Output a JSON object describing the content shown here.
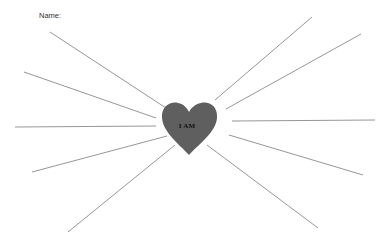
{
  "worksheet": {
    "name_label": "Name:",
    "heart_text": "I AM",
    "heart_color": "#5f5f5f",
    "line_color": "#8a8a8a",
    "rays": [
      {
        "x1": 50,
        "y1": 32,
        "x2": 166,
        "y2": 108
      },
      {
        "x1": 24,
        "y1": 72,
        "x2": 156,
        "y2": 118
      },
      {
        "x1": 15,
        "y1": 127,
        "x2": 156,
        "y2": 126
      },
      {
        "x1": 32,
        "y1": 172,
        "x2": 167,
        "y2": 136
      },
      {
        "x1": 68,
        "y1": 232,
        "x2": 175,
        "y2": 145
      },
      {
        "x1": 215,
        "y1": 100,
        "x2": 312,
        "y2": 17
      },
      {
        "x1": 226,
        "y1": 109,
        "x2": 361,
        "y2": 34
      },
      {
        "x1": 232,
        "y1": 121,
        "x2": 375,
        "y2": 120
      },
      {
        "x1": 229,
        "y1": 135,
        "x2": 363,
        "y2": 175
      },
      {
        "x1": 207,
        "y1": 145,
        "x2": 318,
        "y2": 228
      }
    ]
  }
}
